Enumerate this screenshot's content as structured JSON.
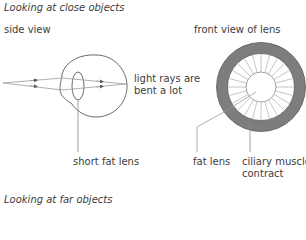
{
  "sections": {
    "close": {
      "heading": "Looking at close objects",
      "side_view_label": "side view",
      "front_view_label": "front view of lens",
      "labels": {
        "rays_line1": "light rays are",
        "rays_line2": "bent a lot",
        "side_lens": "short fat lens",
        "front_lens": "fat lens",
        "muscles_line1": "ciliary muscles",
        "muscles_line2": "contract"
      }
    },
    "far": {
      "heading": "Looking at far objects"
    }
  },
  "colors": {
    "line": "#6a6a6a",
    "muscle_ring": "#7d7d7d",
    "spokes": "#b8b8b8",
    "text": "#3c3c3c"
  }
}
